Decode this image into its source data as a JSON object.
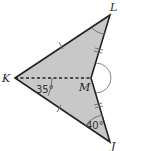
{
  "diagram": {
    "type": "geometry-figure",
    "shape": "concave quadrilateral (dart) KLMJ",
    "fill_color": "#c8c8c8",
    "stroke_color": "#222222",
    "points": {
      "K": {
        "label": "K",
        "x": 15,
        "y": 78
      },
      "L": {
        "label": "L",
        "x": 110,
        "y": 15
      },
      "M": {
        "label": "M",
        "x": 91,
        "y": 78
      },
      "J": {
        "label": "J",
        "x": 110,
        "y": 142
      }
    },
    "segments": [
      {
        "from": "K",
        "to": "L",
        "tick_marks": 1
      },
      {
        "from": "L",
        "to": "M",
        "tick_marks": 2
      },
      {
        "from": "M",
        "to": "J",
        "tick_marks": 2
      },
      {
        "from": "J",
        "to": "K",
        "tick_marks": 1
      },
      {
        "from": "K",
        "to": "M",
        "style": "dashed"
      }
    ],
    "angles": [
      {
        "vertex": "K",
        "label": "35°"
      },
      {
        "vertex": "J",
        "label": "40°"
      },
      {
        "vertex": "L",
        "label": ""
      },
      {
        "vertex": "M",
        "label": "",
        "note": "reflex angle arc"
      }
    ]
  }
}
